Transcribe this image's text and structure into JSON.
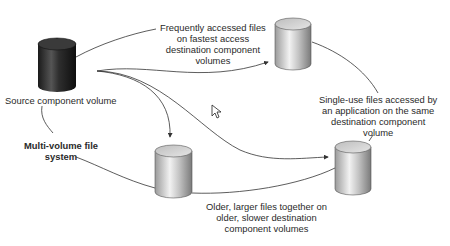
{
  "diagram": {
    "title": "Multi-volume file system",
    "nodes": [
      {
        "id": "source",
        "label": "Source component volume",
        "style": "dark"
      },
      {
        "id": "fast",
        "label": "Frequently accessed files on fastest access destination component volumes",
        "style": "light"
      },
      {
        "id": "older",
        "label": "Older, larger files together on older, slower destination component volumes",
        "style": "light"
      },
      {
        "id": "single",
        "label": "Single-use files accessed by an application on the same destination component volume",
        "style": "light"
      }
    ],
    "edges": [
      {
        "from": "source",
        "to": "fast",
        "arrow": true
      },
      {
        "from": "source",
        "to": "older",
        "arrow": true
      },
      {
        "from": "source",
        "to": "single",
        "arrow": true
      }
    ]
  },
  "labels": {
    "source": "Source component volume",
    "fast": [
      "Frequently accessed files",
      "on fastest access",
      "destination component",
      "volumes"
    ],
    "single": [
      "Single-use files accessed by",
      "an application on the same",
      "destination component",
      "volume"
    ],
    "older": [
      "Older, larger files together on",
      "older, slower destination",
      "component volumes"
    ],
    "mvfs": [
      "Multi-volume file",
      "system"
    ]
  },
  "colors": {
    "line": "#333333",
    "dark_cyl": "#2b2b2b",
    "light_cyl": "#c8c8c8"
  },
  "cursor": "arrow-cursor-icon"
}
